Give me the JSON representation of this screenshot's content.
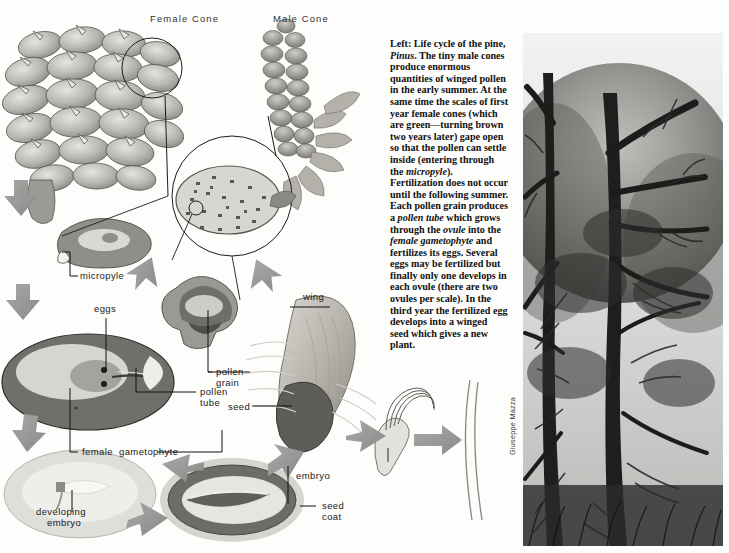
{
  "plate": {
    "background_color": "#fdfdfb",
    "headings": [
      {
        "id": "female-cone",
        "text": "Female Cone"
      },
      {
        "id": "male-cone",
        "text": "Male Cone"
      }
    ]
  },
  "caption": {
    "id": "left-caption",
    "lead": "Left",
    "paragraph_plain": "Left: Life cycle of the pine, Pinus. The tiny male cones produce enormous quantities of winged pollen in the early summer. At the same time the scales of first year female cones (which are green—turning brown two years later) gape open so that the pollen can settle inside (entering through the micropyle). Fertilization does not occur until the following summer. Each pollen grain produces a pollen tube which grows through the ovule into the female gametophyte and fertilizes its eggs. Several eggs may be fertilized but finally only one develops in each ovule (there are two ovules per scale). In the third year the fertilized egg develops into a winged seed which gives a new plant.",
    "segments": [
      {
        "text": "Left: Life cycle of the pine, ",
        "style": "bold"
      },
      {
        "text": "Pinus",
        "style": "bold-italic"
      },
      {
        "text": ". The tiny male cones produce enormous quantities of winged pollen in the early summer. At the same time the scales of first year female cones (which are green—turning brown two years later) gape open so that the pollen can settle inside (entering through the ",
        "style": "bold"
      },
      {
        "text": "micropyle",
        "style": "bold-italic"
      },
      {
        "text": "). Fertilization does not occur until the following summer. Each pollen grain produces a ",
        "style": "bold"
      },
      {
        "text": "pollen tube",
        "style": "bold-italic"
      },
      {
        "text": " which grows through the ",
        "style": "bold"
      },
      {
        "text": "ovule",
        "style": "bold-italic"
      },
      {
        "text": " into the ",
        "style": "bold"
      },
      {
        "text": "female gametophyte",
        "style": "bold-italic"
      },
      {
        "text": " and fertilizes its eggs. Several eggs may be fertilized but finally only one develops in each ovule (there are two ovules per scale). In the third year the fertilized egg develops into a winged seed which gives a new plant.",
        "style": "bold"
      }
    ]
  },
  "diagram_labels": [
    {
      "id": "micropyle",
      "text": "micropyle"
    },
    {
      "id": "eggs",
      "text": "eggs"
    },
    {
      "id": "pollen-grain",
      "text": "pollen\ngrain"
    },
    {
      "id": "pollen-tube",
      "text": "pollen\ntube"
    },
    {
      "id": "female-gametophyte",
      "text": "female  gametophyte"
    },
    {
      "id": "developing-embryo",
      "text": "developing\n  embryo"
    },
    {
      "id": "wing",
      "text": "wing"
    },
    {
      "id": "seed",
      "text": "seed"
    },
    {
      "id": "embryo",
      "text": "embryo"
    },
    {
      "id": "seed-coat",
      "text": "seed\ncoat"
    }
  ],
  "photograph": {
    "id": "pine-forest-photo",
    "credit": "Giuseppe Mazza",
    "description": "Black and white photograph of pine trees"
  },
  "palette": {
    "ink": "#1a1a1a",
    "arrow_gray": "#9a9a9a",
    "cone_gray": "#b8b8b4",
    "ovule_dark": "#6f6f6f",
    "ovule_mid": "#9d9d9a",
    "ovule_light": "#d9d9d4",
    "seed_dark": "#5e5e5c",
    "paper": "#fdfdfb"
  }
}
